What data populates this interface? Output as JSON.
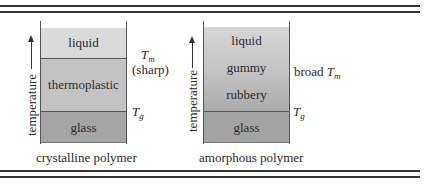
{
  "figure": {
    "colors": {
      "rule": "#333333",
      "liquid_crystalline": "#dadada",
      "thermoplastic": "#c3c3c3",
      "glass": "#a5a5a5",
      "amorphous_gradient_top": "#d6d6d6",
      "amorphous_gradient_bottom": "#ababab",
      "amorphous_glass": "#a3a3a3"
    },
    "left_panel": {
      "axis_label": "temperature",
      "regions": [
        {
          "label": "liquid"
        },
        {
          "label": "thermoplastic"
        },
        {
          "label": "glass"
        }
      ],
      "tm_symbol": "T",
      "tm_subscript": "m",
      "tm_note": "(sharp)",
      "tg_symbol": "T",
      "tg_subscript": "g",
      "caption": "crystalline polymer"
    },
    "right_panel": {
      "axis_label": "temperature",
      "regions": [
        {
          "label": "liquid"
        },
        {
          "label": "gummy"
        },
        {
          "label": "rubbery"
        },
        {
          "label": "glass"
        }
      ],
      "tm_prefix": "broad",
      "tm_symbol": "T",
      "tm_subscript": "m",
      "tg_symbol": "T",
      "tg_subscript": "g",
      "caption": "amorphous polymer"
    }
  }
}
